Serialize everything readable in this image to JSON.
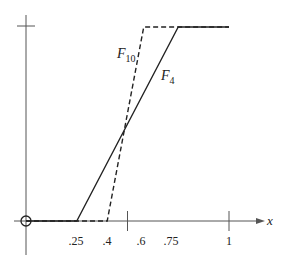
{
  "chart_data": {
    "type": "line",
    "title": "",
    "xlabel": "x",
    "ylabel": "",
    "xlim": [
      0,
      1.15
    ],
    "ylim": [
      0,
      1
    ],
    "grid": false,
    "x_tick_labels": [
      ".25",
      ".4",
      ".6",
      ".75",
      "1"
    ],
    "x_tick_marks": [
      0.5,
      1
    ],
    "y_tick_marks": [
      1
    ],
    "series": [
      {
        "name": "F_4",
        "label_main": "F",
        "label_sub": "4",
        "style": "solid",
        "x": [
          0,
          0.25,
          0.75,
          1
        ],
        "y": [
          0,
          0,
          1,
          1
        ]
      },
      {
        "name": "F_10",
        "label_main": "F",
        "label_sub": "10",
        "style": "dashed",
        "x": [
          0,
          0.4,
          0.58,
          1
        ],
        "y": [
          0,
          0,
          1,
          1
        ]
      }
    ],
    "annotations": [
      {
        "type": "open-circle",
        "x": 0,
        "y": 0
      }
    ]
  }
}
